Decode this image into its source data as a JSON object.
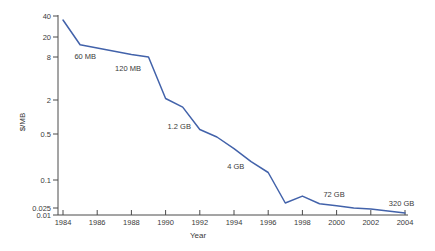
{
  "chart_data": {
    "type": "line",
    "title": "",
    "xlabel": "Year",
    "ylabel": "$/MB",
    "y_scale": "log",
    "grid": false,
    "legend": "none",
    "x_range": [
      1984,
      2004
    ],
    "y_range": [
      0.01,
      40
    ],
    "x": [
      1984,
      1985,
      1986,
      1987,
      1988,
      1989,
      1990,
      1991,
      1992,
      1993,
      1994,
      1995,
      1996,
      1997,
      1998,
      1999,
      2000,
      2001,
      2002,
      2003,
      2004
    ],
    "values": [
      35,
      14,
      12,
      10.4,
      9,
      8,
      2.1,
      1.5,
      0.6,
      0.45,
      0.3,
      0.19,
      0.13,
      0.032,
      0.045,
      0.031,
      0.028,
      0.025,
      0.022,
      0.017,
      0.013
    ],
    "series_name": "Disk storage cost per megabyte",
    "yticks": [
      "40",
      "20",
      "8",
      "2",
      "0.5",
      "0.1",
      "0.025",
      "0.01"
    ],
    "xticks": [
      1984,
      1986,
      1988,
      1990,
      1992,
      1994,
      1996,
      1998,
      2000,
      2002,
      2004
    ],
    "annotations": [
      {
        "label": "60 MB",
        "year": 1985.3,
        "value": 8.4
      },
      {
        "label": "120 MB",
        "year": 1987.8,
        "value": 5.5
      },
      {
        "label": "1.2 GB",
        "year": 1990.8,
        "value": 0.69
      },
      {
        "label": "4 GB",
        "year": 1994.1,
        "value": 0.16
      },
      {
        "label": "72 GB",
        "year": 1999.85,
        "value": 0.05
      },
      {
        "label": "320 GB",
        "year": 2003.8,
        "value": 0.031
      }
    ],
    "colors": {
      "line": "#4262aa",
      "axis": "#4a4a4a",
      "text": "#3a3a3a",
      "background": "#ffffff"
    }
  }
}
